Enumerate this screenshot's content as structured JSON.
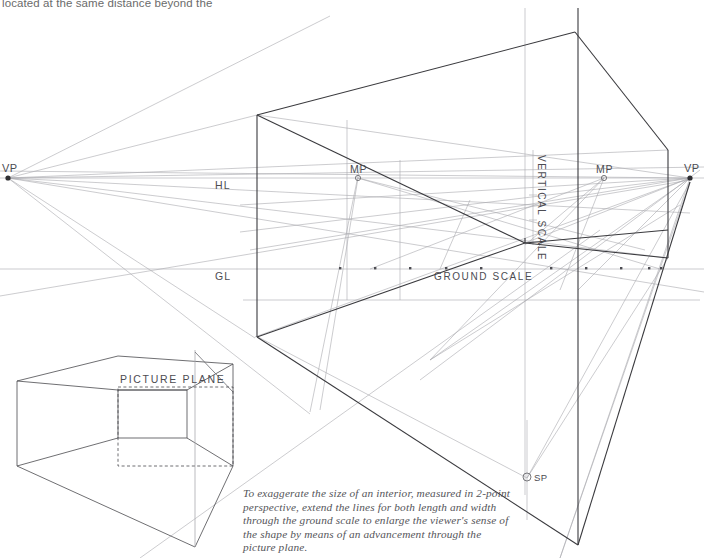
{
  "page": {
    "top_note": "located at the same distance beyond the",
    "caption": "To exaggerate the size of an interior, measured in 2-point perspective, extend the lines for both length and width through the ground scale to enlarge the viewer's sense of the shape by means of an advancement through the picture plane."
  },
  "labels": {
    "vp_left": "VP",
    "vp_right": "VP",
    "mp_left": "MP",
    "mp_right": "MP",
    "horizon_line": "HL",
    "ground_line": "GL",
    "vertical_scale": "VERTICAL SCALE",
    "ground_scale": "GROUND SCALE",
    "station_point": "SP",
    "picture_plane": "PICTURE PLANE"
  },
  "geometry": {
    "vp_left_point": [
      8,
      178
    ],
    "vp_right_point": [
      690,
      178
    ],
    "mp_left_point": [
      358,
      178
    ],
    "mp_right_point": [
      604,
      178
    ],
    "sp_point": [
      527,
      478
    ],
    "horizon_y": 178,
    "ground_y": 269,
    "picture_plane_x": 525,
    "center_vertical_x": 525,
    "ground_scale_ticks": [
      340,
      375,
      410,
      446,
      481,
      516,
      551,
      586,
      621,
      656
    ],
    "box_top_left": [
      257,
      115
    ],
    "box_top_right": [
      575,
      32
    ],
    "box_bottom_left": [
      257,
      337
    ],
    "box_right_vertical_x": 668
  },
  "colors": {
    "construction_line": "#a9a9ae",
    "object_line": "#3a3a3e",
    "text": "#4c4c52",
    "note_text": "#6b6b6b",
    "caption_text": "#55555a",
    "background": "#ffffff"
  }
}
